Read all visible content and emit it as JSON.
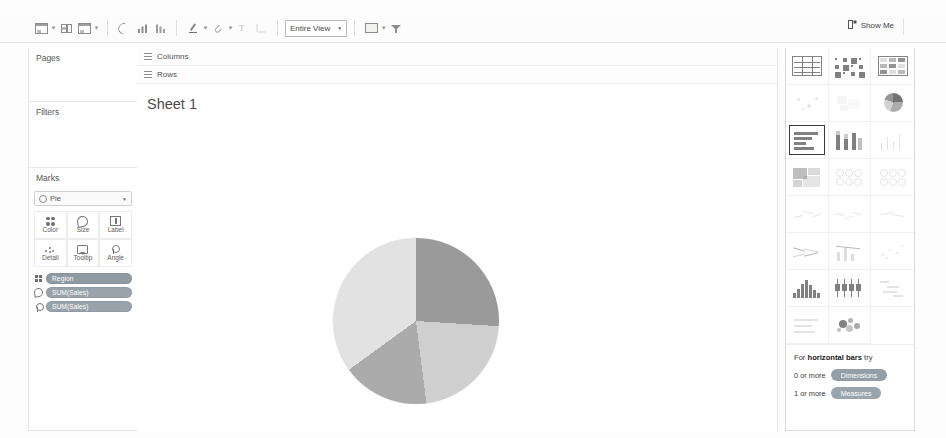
{
  "app": {
    "name": "Tableau Desktop"
  },
  "toolbar": {
    "buttons": [
      {
        "name": "new-worksheet",
        "icon": "sheet-icon",
        "caret": true
      },
      {
        "name": "new-dashboard",
        "icon": "dashboard-icon",
        "caret": false
      },
      {
        "name": "new-story",
        "icon": "story-icon",
        "caret": true
      },
      {
        "name": "undo",
        "icon": "undo-icon",
        "caret": false
      },
      {
        "name": "sort-ascending",
        "icon": "sort-asc-icon",
        "caret": false
      },
      {
        "name": "sort-descending",
        "icon": "sort-desc-icon",
        "caret": false
      },
      {
        "name": "highlight",
        "icon": "pencil-icon",
        "caret": true
      },
      {
        "name": "group-members",
        "icon": "paperclip-icon",
        "caret": true
      },
      {
        "name": "show-mark-labels",
        "icon": "label-icon",
        "caret": false
      },
      {
        "name": "fix-axes",
        "icon": "axes-icon",
        "caret": false
      },
      {
        "name": "presentation-mode",
        "icon": "card-icon",
        "caret": true
      },
      {
        "name": "show-hide-cards",
        "icon": "filter-icon",
        "caret": false
      }
    ],
    "fit_select": {
      "label": "Entire View",
      "caret": "▼"
    },
    "show_me": {
      "label": "Show Me",
      "icon": "showme-icon"
    }
  },
  "sidebar": {
    "pages": {
      "title": "Pages"
    },
    "filters": {
      "title": "Filters"
    },
    "marks": {
      "title": "Marks",
      "mark_type": {
        "value": "Pie",
        "caret": "▼",
        "icon": "pie-mark-icon"
      },
      "buttons": [
        {
          "label": "Color",
          "icon": "color-icon"
        },
        {
          "label": "Size",
          "icon": "size-icon"
        },
        {
          "label": "Label",
          "icon": "label-icon"
        },
        {
          "label": "Detail",
          "icon": "detail-icon"
        },
        {
          "label": "Tooltip",
          "icon": "tooltip-icon"
        },
        {
          "label": "Angle",
          "icon": "angle-icon"
        }
      ],
      "pills": [
        {
          "label": "Region",
          "kind": "dimension",
          "shelf_icon": "color-icon"
        },
        {
          "label": "SUM(Sales)",
          "kind": "measure",
          "shelf_icon": "size-icon"
        },
        {
          "label": "SUM(Sales)",
          "kind": "measure",
          "shelf_icon": "angle-icon"
        }
      ]
    }
  },
  "shelves": {
    "columns": {
      "label": "Columns",
      "value": ""
    },
    "rows": {
      "label": "Rows",
      "value": ""
    }
  },
  "worksheet": {
    "title": "Sheet 1"
  },
  "chart_data": {
    "type": "pie",
    "title": "Sheet 1",
    "labels": [
      "Region A",
      "Region B",
      "Region C",
      "Region D"
    ],
    "values": [
      26,
      22,
      17,
      35
    ],
    "colors": [
      "#9a9a9a",
      "#cfcfcf",
      "#ababab",
      "#e2e2e2"
    ],
    "start_angle": 0,
    "legend": "none",
    "grid": false
  },
  "show_me": {
    "thumbnails": [
      {
        "name": "text-table",
        "selected": false
      },
      {
        "name": "heat-map",
        "selected": false
      },
      {
        "name": "highlight-table",
        "selected": false
      },
      {
        "name": "symbol-map",
        "selected": false
      },
      {
        "name": "filled-map",
        "selected": false
      },
      {
        "name": "pie-chart",
        "selected": false
      },
      {
        "name": "horizontal-bars",
        "selected": true
      },
      {
        "name": "stacked-bars",
        "selected": false
      },
      {
        "name": "side-by-side-bars",
        "selected": false
      },
      {
        "name": "treemap",
        "selected": false
      },
      {
        "name": "circle-views",
        "selected": false
      },
      {
        "name": "side-by-side-circles",
        "selected": false
      },
      {
        "name": "continuous-lines",
        "selected": false
      },
      {
        "name": "discrete-lines",
        "selected": false
      },
      {
        "name": "continuous-area",
        "selected": false
      },
      {
        "name": "dual-lines",
        "selected": false
      },
      {
        "name": "dual-combination",
        "selected": false
      },
      {
        "name": "scatter-plot",
        "selected": false
      },
      {
        "name": "histogram",
        "selected": false
      },
      {
        "name": "box-and-whisker",
        "selected": false
      },
      {
        "name": "gantt",
        "selected": false
      },
      {
        "name": "bullet-graph",
        "selected": false
      },
      {
        "name": "packed-bubbles",
        "selected": false
      }
    ],
    "hint": {
      "prefix": "For ",
      "chart_name": "horizontal bars",
      "suffix": " try",
      "requirements": [
        {
          "count": "0 or more",
          "pill": "Dimensions"
        },
        {
          "count": "1 or more",
          "pill": "Measures"
        }
      ]
    }
  }
}
